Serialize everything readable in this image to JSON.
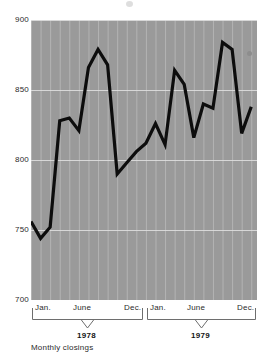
{
  "caption": "Monthly closings",
  "colors": {
    "plot_background": "#9a9a9a",
    "gridline": "#c9c9c9",
    "data_line": "#0d0d0d",
    "text": "#2b2b2b",
    "year_text": "#141414"
  },
  "yaxis": {
    "ticks": [
      "900",
      "850",
      "800",
      "750",
      "700"
    ],
    "min": 700,
    "max": 900
  },
  "xaxis": {
    "month_labels": [
      "Jan.",
      "June",
      "Dec.",
      "Jan.",
      "June",
      "Dec."
    ],
    "year_groups": [
      "1978",
      "1979"
    ]
  },
  "chart_data": {
    "type": "line",
    "title": "",
    "subtitle": "",
    "xlabel": "",
    "ylabel": "",
    "annotations": [
      "Monthly closings"
    ],
    "grid": true,
    "legend": "none",
    "ylim": [
      700,
      900
    ],
    "ytick_labels": [
      "700",
      "750",
      "800",
      "850",
      "900"
    ],
    "ytick_values": [
      700,
      750,
      800,
      850,
      900
    ],
    "xtick_labels": [
      "Jan.",
      "June",
      "Dec.",
      "Jan.",
      "June",
      "Dec."
    ],
    "xtick_index": [
      0,
      5,
      11,
      12,
      17,
      23
    ],
    "x": [
      "Jan. 1978",
      "Feb. 1978",
      "Mar. 1978",
      "Apr. 1978",
      "May 1978",
      "June 1978",
      "July 1978",
      "Aug. 1978",
      "Sep. 1978",
      "Oct. 1978",
      "Nov. 1978",
      "Dec. 1978",
      "Jan. 1979",
      "Feb. 1979",
      "Mar. 1979",
      "Apr. 1979",
      "May 1979",
      "June 1979",
      "July 1979",
      "Aug. 1979",
      "Sep. 1979",
      "Oct. 1979",
      "Nov. 1979",
      "Dec. 1979"
    ],
    "series": [
      {
        "name": "Monthly closings",
        "values": [
          756,
          744,
          752,
          828,
          830,
          821,
          866,
          879,
          868,
          790,
          798,
          806,
          812,
          826,
          811,
          864,
          854,
          816,
          840,
          837,
          884,
          879,
          819,
          838
        ]
      }
    ]
  }
}
